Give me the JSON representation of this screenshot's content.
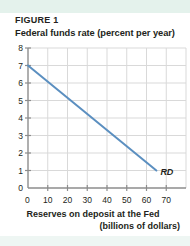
{
  "figure": {
    "label": "FIGURE 1"
  },
  "chart_data": {
    "type": "line",
    "title": "FIGURE 1",
    "ylabel": "Federal funds rate (percent per year)",
    "xlabel": "Reserves on deposit at the Fed",
    "xlabel_line2": "(billions of dollars)",
    "xlim": [
      0,
      80
    ],
    "ylim": [
      0,
      8
    ],
    "xticks": [
      0,
      10,
      20,
      30,
      40,
      50,
      60,
      70
    ],
    "yticks": [
      0,
      1,
      2,
      3,
      4,
      5,
      6,
      7,
      8
    ],
    "grid": true,
    "legend": "none",
    "series": [
      {
        "name": "RD",
        "annotation": "RD",
        "color": "#5b8fc0",
        "points": [
          {
            "x": 0,
            "y": 7
          },
          {
            "x": 65,
            "y": 1
          }
        ]
      }
    ]
  },
  "colors": {
    "curve": "#5b8fc0",
    "axis": "#8d8d8d",
    "grid": "#d9d9d9",
    "band": "#e4f2ec",
    "text": "#231f20"
  }
}
